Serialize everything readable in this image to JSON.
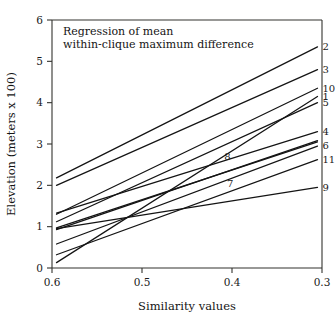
{
  "chart_data": {
    "type": "line",
    "title": "Regression of mean within-clique maximum difference",
    "title_line1": "Regression of mean",
    "title_line2": "within-clique maximum difference",
    "xlabel": "Similarity values",
    "ylabel": "Elevation (meters x 100)",
    "xlim": [
      0.6,
      0.3
    ],
    "ylim": [
      0,
      6
    ],
    "x_reversed": true,
    "grid": false,
    "legend_position": "inline-right-of-line-end",
    "xticks": [
      "0.6",
      "0.5",
      "0.4",
      "0.3"
    ],
    "xtick_values": [
      0.6,
      0.5,
      0.4,
      0.3
    ],
    "yticks": [
      "0",
      "1",
      "2",
      "3",
      "4",
      "5",
      "6"
    ],
    "ytick_values": [
      0,
      1,
      2,
      3,
      4,
      5,
      6
    ],
    "series": [
      {
        "name": "2",
        "label": "2",
        "label_side": "right",
        "x": [
          0.595,
          0.305
        ],
        "values": [
          2.18,
          5.35
        ]
      },
      {
        "name": "3",
        "label": "3",
        "label_side": "right",
        "x": [
          0.595,
          0.305
        ],
        "values": [
          2.0,
          4.8
        ]
      },
      {
        "name": "10",
        "label": "10",
        "label_side": "right",
        "x": [
          0.595,
          0.305
        ],
        "values": [
          1.3,
          4.35
        ]
      },
      {
        "name": "1",
        "label": "1",
        "label_side": "right",
        "x": [
          0.595,
          0.305
        ],
        "values": [
          0.13,
          4.15
        ]
      },
      {
        "name": "5",
        "label": "5",
        "label_side": "right",
        "x": [
          0.595,
          0.305
        ],
        "values": [
          1.12,
          4.0
        ]
      },
      {
        "name": "4",
        "label": "4",
        "label_side": "right",
        "x": [
          0.595,
          0.305
        ],
        "values": [
          1.33,
          3.3
        ]
      },
      {
        "name": "6",
        "label": "6",
        "label_side": "right",
        "x": [
          0.595,
          0.305
        ],
        "values": [
          0.58,
          2.95
        ]
      },
      {
        "name": "11",
        "label": "11",
        "label_side": "right",
        "x": [
          0.595,
          0.305
        ],
        "values": [
          0.32,
          2.62
        ]
      },
      {
        "name": "9",
        "label": "9",
        "label_side": "right",
        "x": [
          0.595,
          0.305
        ],
        "values": [
          0.95,
          1.95
        ]
      },
      {
        "name": "8",
        "label": "8",
        "label_side": "inline",
        "label_x": 0.405,
        "label_y": 2.62,
        "x": [
          0.595,
          0.305
        ],
        "values": [
          0.93,
          3.08
        ]
      },
      {
        "name": "7",
        "label": "7",
        "label_side": "inline",
        "label_x": 0.402,
        "label_y": 1.95,
        "x": [
          0.595,
          0.305
        ],
        "values": [
          0.97,
          3.05
        ]
      }
    ],
    "colors": {
      "line": "#141414",
      "axis": "#33332e",
      "text": "#1a1a1a",
      "background": "#ffffff"
    }
  }
}
